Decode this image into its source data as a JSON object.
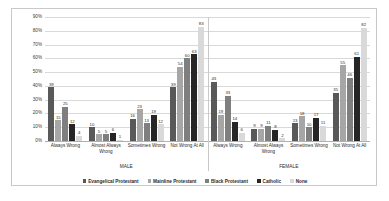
{
  "chart_data": {
    "type": "bar",
    "title": "",
    "xlabel": "",
    "ylabel": "",
    "ylim": [
      0,
      90
    ],
    "ytick_labels": [
      "90%",
      "80%",
      "70%",
      "60%",
      "50%",
      "40%",
      "30%",
      "20%",
      "10%",
      "0%"
    ],
    "grid": true,
    "legend_position": "bottom",
    "supergroups": [
      "MALE",
      "FEMALE"
    ],
    "categories": [
      "Always Wrong",
      "Almost Always Wrong",
      "Sometimes Wrong",
      "Not Wrong At All"
    ],
    "series": [
      {
        "name": "Evangelical Protestant",
        "color": "#595959",
        "values_male": [
          39,
          10,
          16,
          39
        ],
        "values_female": [
          43,
          9,
          13,
          35
        ]
      },
      {
        "name": "Mainline Protestant",
        "color": "#a6a6a6",
        "values_male": [
          15,
          5,
          23,
          54
        ],
        "values_female": [
          19,
          9,
          18,
          55
        ]
      },
      {
        "name": "Black Protestant",
        "color": "#7f7f7f",
        "values_male": [
          25,
          5,
          13,
          60
        ],
        "values_female": [
          33,
          11,
          10,
          46
        ]
      },
      {
        "name": "Catholic",
        "color": "#262626",
        "values_male": [
          12,
          6,
          19,
          63
        ],
        "values_female": [
          14,
          8,
          17,
          61
        ]
      },
      {
        "name": "None",
        "color": "#d9d9d9",
        "values_male": [
          4,
          1,
          12,
          83
        ],
        "values_female": [
          6,
          2,
          11,
          82
        ]
      }
    ]
  }
}
